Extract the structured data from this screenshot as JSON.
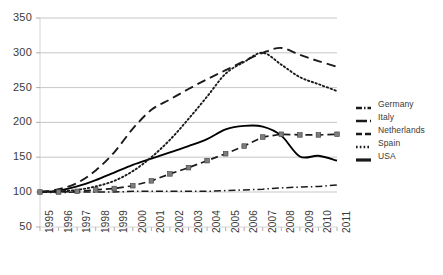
{
  "chart_data": {
    "type": "line",
    "title": "",
    "xlabel": "",
    "ylabel": "",
    "grid": true,
    "legend_position": "right",
    "xlim": [
      1995,
      2011
    ],
    "ylim": [
      50,
      350
    ],
    "ytick_values": [
      350,
      300,
      250,
      200,
      150,
      100,
      50
    ],
    "ytick_labels": [
      "350",
      "300",
      "250",
      "200",
      "150",
      "100",
      "50"
    ],
    "categories": [
      1995,
      1996,
      1997,
      1998,
      1999,
      2000,
      2001,
      2002,
      2003,
      2004,
      2005,
      2006,
      2007,
      2008,
      2009,
      2010,
      2011
    ],
    "xtick_labels": [
      "1995",
      "1996",
      "1997",
      "1998",
      "1999",
      "2000",
      "2001",
      "2002",
      "2003",
      "2004",
      "2005",
      "2006",
      "2007",
      "2008",
      "2009",
      "2010",
      "2011"
    ],
    "series": [
      {
        "name": "Germany",
        "style": "dash-dot",
        "color": "#1a1a1a",
        "marker": "none",
        "values": [
          100,
          99,
          100,
          100,
          100,
          101,
          101,
          101,
          101,
          101,
          102,
          103,
          104,
          106,
          107,
          108,
          110
        ]
      },
      {
        "name": "Italy",
        "style": "dashed",
        "color": "#1a1a1a",
        "marker": "square",
        "values": [
          100,
          100,
          101,
          103,
          105,
          109,
          116,
          126,
          135,
          145,
          155,
          166,
          179,
          183,
          182,
          182,
          183
        ]
      },
      {
        "name": "Netherlands",
        "style": "solid",
        "color": "#000000",
        "marker": "none",
        "values": [
          100,
          102,
          108,
          117,
          128,
          139,
          148,
          157,
          166,
          176,
          190,
          195,
          194,
          181,
          151,
          152,
          145
        ]
      },
      {
        "name": "Spain",
        "style": "dotted",
        "color": "#1a1a1a",
        "marker": "none",
        "values": [
          100,
          101,
          103,
          108,
          116,
          130,
          150,
          175,
          205,
          237,
          270,
          287,
          300,
          283,
          265,
          255,
          245
        ]
      },
      {
        "name": "USA",
        "style": "long-dash",
        "color": "#1a1a1a",
        "marker": "none",
        "values": [
          100,
          104,
          113,
          131,
          157,
          191,
          218,
          233,
          248,
          262,
          275,
          288,
          300,
          307,
          297,
          288,
          280
        ]
      }
    ]
  },
  "legend": {
    "items": [
      {
        "label": "Germany",
        "style": "dash-dot"
      },
      {
        "label": "Italy",
        "style": "dashed"
      },
      {
        "label": "Netherlands",
        "style": "long-dash"
      },
      {
        "label": "Spain",
        "style": "dotted"
      },
      {
        "label": "USA",
        "style": "solid-thick"
      }
    ]
  }
}
